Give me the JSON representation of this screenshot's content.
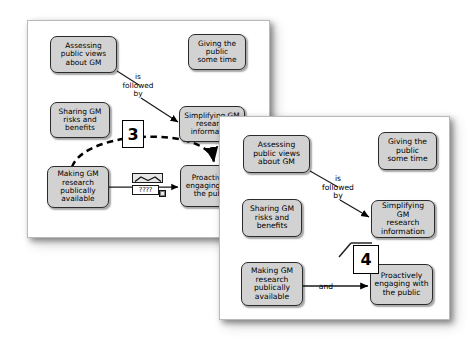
{
  "figure": {
    "background_color": "#ffffff",
    "node_fill": "#d2d2d2",
    "node_border": "#2b2b2b",
    "callout_border": "#000000"
  },
  "panels": [
    {
      "id": "panel-1",
      "callout_number": "3",
      "nodes": [
        {
          "key": "assessing",
          "label": "Assessing\npublic views\nabout GM"
        },
        {
          "key": "giving",
          "label": "Giving the\npublic\nsome time"
        },
        {
          "key": "sharing",
          "label": "Sharing GM\nrisks and\nbenefits"
        },
        {
          "key": "simplifying",
          "label": "Simplifying GM\nresearch\ninformation"
        },
        {
          "key": "making",
          "label": "Making GM\nresearch\npublically\navailable"
        },
        {
          "key": "proactively",
          "label": "Proactively\nengaging with\nthe public"
        }
      ],
      "link_labels": [
        {
          "key": "is_followed_by",
          "label": "is\nfollowed\nby"
        }
      ],
      "widget": {
        "name": "link-label-editor",
        "field_value": "????"
      }
    },
    {
      "id": "panel-2",
      "callout_number": "4",
      "nodes": [
        {
          "key": "assessing",
          "label": "Assessing\npublic views\nabout GM"
        },
        {
          "key": "giving",
          "label": "Giving the\npublic\nsome time"
        },
        {
          "key": "sharing",
          "label": "Sharing GM\nrisks and\nbenefits"
        },
        {
          "key": "simplifying",
          "label": "Simplifying GM\nresearch\ninformation"
        },
        {
          "key": "making",
          "label": "Making GM\nresearch\npublically\navailable"
        },
        {
          "key": "proactively",
          "label": "Proactively\nengaging with\nthe public"
        }
      ],
      "link_labels": [
        {
          "key": "is_followed_by",
          "label": "is\nfollowed\nby"
        },
        {
          "key": "and",
          "label": "and"
        }
      ]
    }
  ]
}
